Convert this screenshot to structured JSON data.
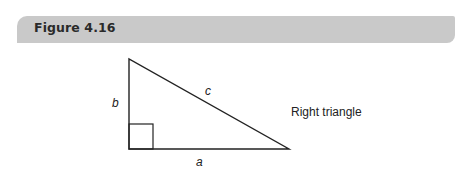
{
  "header": {
    "title": "Figure 4.16"
  },
  "diagram": {
    "shape": "right-triangle",
    "vertices": {
      "top": [
        129,
        59
      ],
      "bottom_left": [
        129,
        149
      ],
      "bottom_right": [
        289,
        149
      ]
    },
    "right_angle_marker": {
      "x": 129,
      "y": 124,
      "size": 25
    },
    "labels": {
      "a": "a",
      "b": "b",
      "c": "c",
      "caption": "Right triangle"
    },
    "colors": {
      "stroke": "#222222",
      "header_bg": "#c9c9c9"
    }
  }
}
